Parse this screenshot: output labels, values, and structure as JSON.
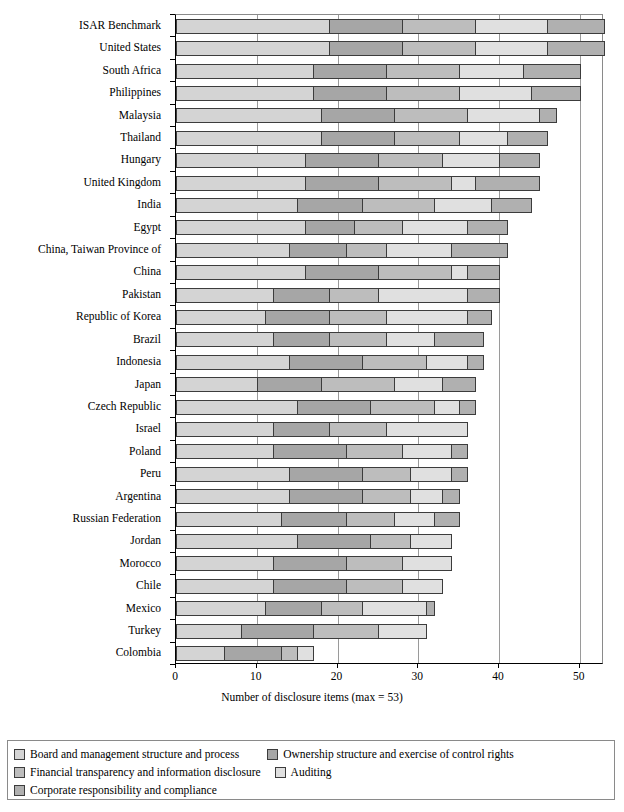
{
  "chart_data": {
    "type": "bar",
    "orientation": "horizontal",
    "stacked": true,
    "title": "",
    "xlabel": "Number of disclosure items (max = 53)",
    "ylabel": "",
    "xlim": [
      0,
      53
    ],
    "xticks": [
      0,
      10,
      20,
      30,
      40,
      50
    ],
    "grid": true,
    "legend_position": "bottom",
    "series": [
      {
        "name": "Board and management structure and process",
        "color": "#d4d4d4"
      },
      {
        "name": "Ownership structure and exercise of control rights",
        "color": "#a6a6a6"
      },
      {
        "name": "Financial transparency and information disclosure",
        "color": "#bdbdbd"
      },
      {
        "name": "Auditing",
        "color": "#e0e0e0"
      },
      {
        "name": "Corporate responsibility and compliance",
        "color": "#b0b0b0"
      }
    ],
    "categories": [
      "ISAR Benchmark",
      "United States",
      "South Africa",
      "Philippines",
      "Malaysia",
      "Thailand",
      "Hungary",
      "United Kingdom",
      "India",
      "Egypt",
      "China, Taiwan Province of",
      "China",
      "Pakistan",
      "Republic of Korea",
      "Brazil",
      "Indonesia",
      "Japan",
      "Czech Republic",
      "Israel",
      "Poland",
      "Peru",
      "Argentina",
      "Russian Federation",
      "Jordan",
      "Morocco",
      "Chile",
      "Mexico",
      "Turkey",
      "Colombia"
    ],
    "values": [
      [
        19,
        9,
        9,
        9,
        7
      ],
      [
        19,
        9,
        9,
        9,
        7
      ],
      [
        17,
        9,
        9,
        8,
        7
      ],
      [
        17,
        9,
        9,
        9,
        6
      ],
      [
        18,
        9,
        9,
        9,
        2
      ],
      [
        18,
        9,
        8,
        6,
        5
      ],
      [
        16,
        9,
        8,
        7,
        5
      ],
      [
        16,
        9,
        9,
        3,
        8
      ],
      [
        15,
        8,
        9,
        7,
        5
      ],
      [
        16,
        6,
        6,
        8,
        5
      ],
      [
        14,
        7,
        5,
        8,
        7
      ],
      [
        16,
        9,
        9,
        2,
        4
      ],
      [
        12,
        7,
        6,
        11,
        4
      ],
      [
        11,
        8,
        7,
        10,
        3
      ],
      [
        12,
        7,
        7,
        6,
        6
      ],
      [
        14,
        9,
        8,
        5,
        2
      ],
      [
        10,
        8,
        9,
        6,
        4
      ],
      [
        15,
        9,
        8,
        3,
        2
      ],
      [
        12,
        7,
        7,
        10,
        0
      ],
      [
        12,
        9,
        7,
        6,
        2
      ],
      [
        14,
        9,
        6,
        5,
        2
      ],
      [
        14,
        9,
        6,
        4,
        2
      ],
      [
        13,
        8,
        6,
        5,
        3
      ],
      [
        15,
        9,
        5,
        5,
        0
      ],
      [
        12,
        9,
        7,
        6,
        0
      ],
      [
        12,
        9,
        7,
        5,
        0
      ],
      [
        11,
        7,
        5,
        8,
        1
      ],
      [
        8,
        9,
        8,
        6,
        0
      ],
      [
        6,
        7,
        2,
        2,
        0
      ]
    ],
    "totals": [
      53,
      53,
      50,
      50,
      47,
      46,
      45,
      45,
      44,
      41,
      41,
      40,
      40,
      39,
      38,
      38,
      37,
      37,
      36,
      36,
      36,
      35,
      35,
      34,
      34,
      33,
      32,
      31,
      17
    ]
  },
  "legend": {
    "items": [
      "Board and management structure and process",
      "Ownership structure and exercise of control rights",
      "Financial transparency and information disclosure",
      "Auditing",
      "Corporate responsibility and compliance"
    ]
  },
  "axis": {
    "x_title": "Number of disclosure items (max = 53)",
    "x_tick_labels": [
      "0",
      "10",
      "20",
      "30",
      "40",
      "50"
    ]
  }
}
